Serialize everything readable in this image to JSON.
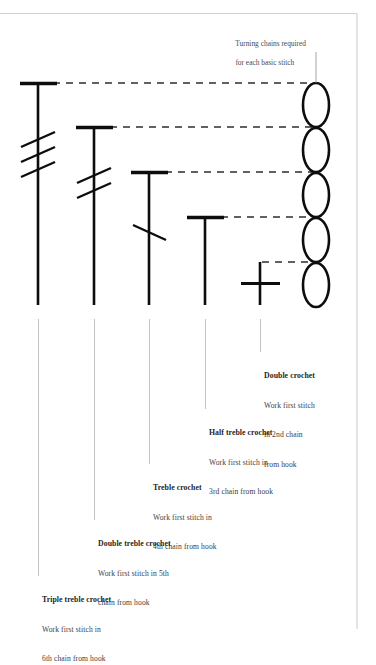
{
  "page": {
    "background_color": "#ffffff",
    "border_color": "#cfcfcf",
    "ink_color": "#111111",
    "leader_color": "#b0b0b0",
    "text_color": "#3a3a3a"
  },
  "caption": {
    "line1": "Turning chains required",
    "line2": "for each basic stitch"
  },
  "chain": {
    "name": "turning-chain-stack",
    "stitch_count": 5,
    "symbol": "oval"
  },
  "stitches": [
    {
      "id": "triple-treble-crochet",
      "symbol": "vertical-bar-with-top-cross-and-3-slashes",
      "slashes": 3,
      "title": "Triple treble crochet",
      "body_lines": [
        "Work first stitch in",
        "6th chain from hook"
      ],
      "chain_number": "6th"
    },
    {
      "id": "double-treble-crochet",
      "symbol": "vertical-bar-with-top-cross-and-2-slashes",
      "slashes": 2,
      "title": "Double treble crochet",
      "body_lines": [
        "Work first stitch in 5th",
        "chain from hook"
      ],
      "chain_number": "5th"
    },
    {
      "id": "treble-crochet",
      "symbol": "vertical-bar-with-top-cross-and-1-slash",
      "slashes": 1,
      "title": "Treble crochet",
      "body_lines": [
        "Work first stitch in",
        "4th chain from hook"
      ],
      "chain_number": "4th"
    },
    {
      "id": "half-treble-crochet",
      "symbol": "vertical-bar-with-top-cross",
      "slashes": 0,
      "title": "Half treble crochet",
      "body_lines": [
        "Work first stitch in",
        "3rd chain from hook"
      ],
      "chain_number": "3rd"
    },
    {
      "id": "double-crochet",
      "symbol": "plus-cross",
      "slashes": 0,
      "title": "Double crochet",
      "body_lines": [
        "Work first stitch",
        "in 2nd chain",
        "from hook"
      ],
      "chain_number": "2nd"
    }
  ]
}
